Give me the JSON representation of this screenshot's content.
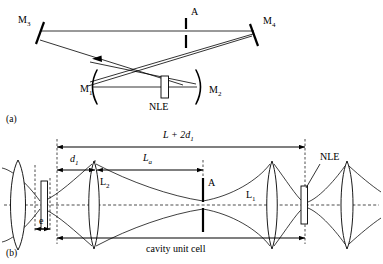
{
  "figure": {
    "panels": [
      {
        "id": "a",
        "label": "(a)",
        "caption_note": "Folded X-cavity with four mirrors, aperture and nonlinear element",
        "elements": {
          "mirror_m3": "M",
          "mirror_m3_sub": "3",
          "mirror_m4": "M",
          "mirror_m4_sub": "4",
          "mirror_m1": "M",
          "mirror_m1_sub": "1",
          "mirror_m2": "M",
          "mirror_m2_sub": "2",
          "aperture": "A",
          "nonlinear_element": "NLE"
        }
      },
      {
        "id": "b",
        "label": "(b)",
        "caption_note": "Equivalent unfolded lens-guide representation of the cavity unit cell",
        "elements": {
          "lens_l1": "L",
          "lens_l1_sub": "1",
          "lens_l2": "L",
          "lens_l2_sub": "2",
          "aperture": "A",
          "nonlinear_element": "NLE"
        },
        "dimensions": {
          "total_span": "L + 2d",
          "total_span_sub": "1",
          "arm_d1": "d",
          "arm_d1_sub": "1",
          "length_la": "L",
          "length_la_sub": "a",
          "crystal_thickness": "e",
          "unit_cell": "cavity unit cell"
        }
      }
    ]
  },
  "colors": {
    "ink": "#000000",
    "background": "#ffffff"
  }
}
